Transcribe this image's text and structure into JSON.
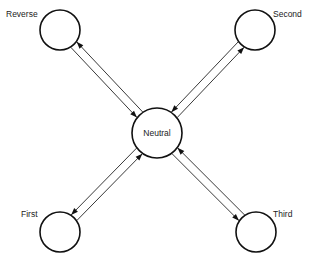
{
  "diagram": {
    "type": "state-transition",
    "nodes": [
      {
        "id": "neutral",
        "label": "Neutral",
        "position": "center"
      },
      {
        "id": "reverse",
        "label": "Reverse",
        "position": "top-left"
      },
      {
        "id": "second",
        "label": "Second",
        "position": "top-right"
      },
      {
        "id": "first",
        "label": "First",
        "position": "bottom-left"
      },
      {
        "id": "third",
        "label": "Third",
        "position": "bottom-right"
      }
    ],
    "edges": [
      {
        "from": "neutral",
        "to": "reverse"
      },
      {
        "from": "reverse",
        "to": "neutral"
      },
      {
        "from": "neutral",
        "to": "second"
      },
      {
        "from": "second",
        "to": "neutral"
      },
      {
        "from": "neutral",
        "to": "first"
      },
      {
        "from": "first",
        "to": "neutral"
      },
      {
        "from": "neutral",
        "to": "third"
      },
      {
        "from": "third",
        "to": "neutral"
      }
    ],
    "colors": {
      "stroke": "#111111",
      "background": "#ffffff"
    }
  }
}
